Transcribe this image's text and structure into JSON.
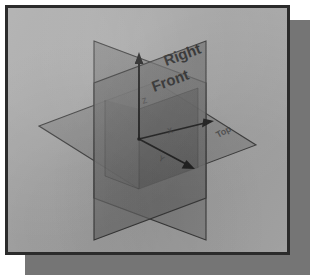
{
  "figure": {
    "colors": {
      "page_background": "#ffffff",
      "paper": "#a9a9a9",
      "frame_border": "#2b2b2b",
      "drop_shadow": "#757575",
      "plane_fill": "#8b8b8b",
      "plane_fill_dark": "#5c5c5c",
      "plane_edge": "#3a3a3a",
      "axis_line": "#222222",
      "label_text": "#2a2a2a"
    },
    "planes": [
      {
        "id": "front",
        "label": "Front",
        "orientation": "vertical-frontal"
      },
      {
        "id": "right",
        "label": "Right",
        "orientation": "vertical-profile"
      },
      {
        "id": "top",
        "label": "Top",
        "orientation": "horizontal"
      }
    ],
    "axes": [
      {
        "id": "z-axis",
        "label": "Z",
        "direction": "up"
      },
      {
        "id": "x-axis",
        "label": "X",
        "direction": "right"
      },
      {
        "id": "y-axis",
        "label": "Y",
        "direction": "down-right-toward-viewer"
      }
    ],
    "labels": {
      "right": "Right",
      "front": "Front",
      "top": "Top"
    },
    "origin_marker": "origin"
  }
}
